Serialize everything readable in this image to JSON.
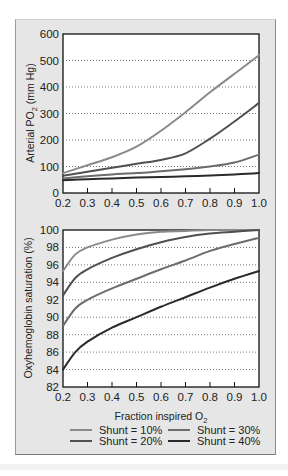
{
  "chart_data": [
    {
      "type": "line",
      "title": "",
      "xlabel": "",
      "ylabel": "Arterial PO2 (mm Hg)",
      "xlim": [
        0.2,
        1.0
      ],
      "ylim": [
        0,
        600
      ],
      "x_ticks": [
        "0.2",
        "0.3",
        "0.4",
        "0.5",
        "0.6",
        "0.7",
        "0.8",
        "0.9",
        "1.0"
      ],
      "y_ticks": [
        "0",
        "100",
        "200",
        "300",
        "400",
        "500",
        "600"
      ],
      "grid": "horizontal dotted",
      "x": [
        0.2,
        0.3,
        0.4,
        0.5,
        0.6,
        0.7,
        0.8,
        0.9,
        1.0
      ],
      "series": [
        {
          "name": "Shunt = 10%",
          "color": "#8a8a8a",
          "values": [
            75,
            105,
            135,
            175,
            235,
            305,
            380,
            450,
            520
          ]
        },
        {
          "name": "Shunt = 20%",
          "color": "#505050",
          "values": [
            65,
            80,
            95,
            110,
            125,
            150,
            205,
            270,
            340
          ]
        },
        {
          "name": "Shunt = 30%",
          "color": "#6c6c6c",
          "values": [
            55,
            63,
            70,
            75,
            82,
            90,
            100,
            115,
            145
          ]
        },
        {
          "name": "Shunt = 40%",
          "color": "#2a2a2a",
          "values": [
            48,
            52,
            55,
            58,
            60,
            63,
            66,
            70,
            75
          ]
        }
      ]
    },
    {
      "type": "line",
      "title": "",
      "xlabel": "Fraction inspired O2",
      "ylabel": "Oxyhemoglobin saturation (%)",
      "xlim": [
        0.2,
        1.0
      ],
      "ylim": [
        82,
        100
      ],
      "x_ticks": [
        "0.2",
        "0.3",
        "0.4",
        "0.5",
        "0.6",
        "0.7",
        "0.8",
        "0.9",
        "1.0"
      ],
      "y_ticks": [
        "82",
        "84",
        "86",
        "88",
        "90",
        "92",
        "94",
        "96",
        "98",
        "100"
      ],
      "grid": "horizontal dotted",
      "x": [
        0.2,
        0.25,
        0.3,
        0.4,
        0.5,
        0.6,
        0.7,
        0.8,
        0.9,
        1.0
      ],
      "series": [
        {
          "name": "Shunt = 10%",
          "color": "#8a8a8a",
          "values": [
            95.3,
            97.2,
            98.0,
            98.9,
            99.5,
            99.8,
            99.9,
            100,
            100,
            100
          ]
        },
        {
          "name": "Shunt = 20%",
          "color": "#505050",
          "values": [
            92.5,
            94.5,
            95.5,
            96.8,
            97.8,
            98.6,
            99.2,
            99.6,
            99.8,
            100
          ]
        },
        {
          "name": "Shunt = 30%",
          "color": "#6c6c6c",
          "values": [
            89.0,
            91.0,
            92.0,
            93.3,
            94.4,
            95.5,
            96.5,
            97.6,
            98.4,
            99.1
          ]
        },
        {
          "name": "Shunt = 40%",
          "color": "#2a2a2a",
          "values": [
            84.0,
            86.0,
            87.2,
            88.8,
            90.0,
            91.2,
            92.3,
            93.4,
            94.4,
            95.3
          ]
        }
      ]
    }
  ],
  "labels": {
    "top_ylabel_main": "Arterial PO",
    "top_ylabel_sub": "2",
    "top_ylabel_tail": " (mm Hg)",
    "bottom_ylabel": "Oxyhemoglobin saturation (%)",
    "xlabel_main": "Fraction inspired O",
    "xlabel_sub": "2"
  },
  "legend": [
    {
      "label": "Shunt = 10%",
      "color": "#8a8a8a"
    },
    {
      "label": "Shunt = 20%",
      "color": "#505050"
    },
    {
      "label": "Shunt = 30%",
      "color": "#6c6c6c"
    },
    {
      "label": "Shunt = 40%",
      "color": "#2a2a2a"
    }
  ]
}
